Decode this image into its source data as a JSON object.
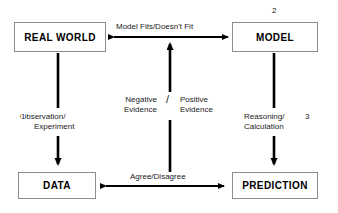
{
  "diagram": {
    "nodes": [
      {
        "id": "real-world",
        "label": "REAL WORLD"
      },
      {
        "id": "model",
        "label": "MODEL"
      },
      {
        "id": "data",
        "label": "DATA"
      },
      {
        "id": "prediction",
        "label": "PREDICTION"
      }
    ],
    "edges": [
      {
        "id": "real-world-model",
        "from": "REAL WORLD",
        "to": "MODEL",
        "direction": "bidirectional",
        "orientation": "horizontal",
        "label": "Model Fits/Doesn't Fit"
      },
      {
        "id": "data-prediction",
        "from": "DATA",
        "to": "PREDICTION",
        "direction": "bidirectional",
        "orientation": "horizontal",
        "label": "Agree/Disagree"
      },
      {
        "id": "real-world-data",
        "from": "REAL WORLD",
        "to": "DATA",
        "direction": "down",
        "orientation": "vertical",
        "label_line1": "Observation/",
        "label_line2": "Experiment",
        "step": "1"
      },
      {
        "id": "model-prediction",
        "from": "MODEL",
        "to": "PREDICTION",
        "direction": "down",
        "orientation": "vertical",
        "label_line1": "Reasoning/",
        "label_line2": "Calculation",
        "step": "3"
      },
      {
        "id": "evidence-up",
        "from": "Agree/Disagree",
        "to": "Model Fits/Doesn't Fit",
        "direction": "up",
        "orientation": "vertical",
        "label_negative_line1": "Negative",
        "label_negative_line2": "Evidence",
        "label_separator": "/",
        "label_positive_line1": "Positive",
        "label_positive_line2": "Evidence"
      }
    ],
    "step_numbers": {
      "step_1": "1",
      "step_2": "2",
      "step_3": "3"
    },
    "colors": {
      "stroke": "#000000",
      "box_border": "#8d8d8d",
      "background": "#ffffff",
      "text": "#000000"
    }
  }
}
